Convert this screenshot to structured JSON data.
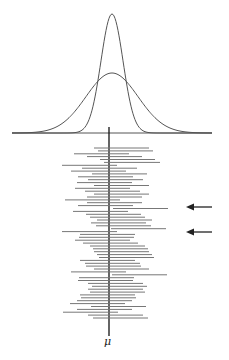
{
  "figure": {
    "mean_label": "μ",
    "curves": [
      {
        "name": "sampling-distribution-narrow",
        "sigma_px": 11,
        "peak_y": 14
      },
      {
        "name": "population-distribution-wide",
        "sigma_px": 26,
        "peak_y": 73
      }
    ],
    "baseline": {
      "x1": 12,
      "x2": 212,
      "y": 133
    },
    "mean_line": {
      "x": 109,
      "y1": 127,
      "y2": 336
    },
    "arrows": [
      {
        "y": 207,
        "x_from": 212,
        "x_to": 186,
        "label": "interval-misses-mean"
      },
      {
        "y": 232,
        "x_from": 212,
        "x_to": 186,
        "label": "interval-misses-mean"
      }
    ],
    "interval_length_px": 56,
    "intervals": [
      [
        94,
        149
      ],
      [
        98,
        153
      ],
      [
        74,
        129
      ],
      [
        87,
        142
      ],
      [
        100,
        155
      ],
      [
        104,
        160
      ],
      [
        62,
        117
      ],
      [
        82,
        137
      ],
      [
        71,
        126
      ],
      [
        92,
        147
      ],
      [
        78,
        133
      ],
      [
        88,
        143
      ],
      [
        77,
        132
      ],
      [
        94,
        149
      ],
      [
        75,
        130
      ],
      [
        85,
        140
      ],
      [
        94,
        149
      ],
      [
        87,
        142
      ],
      [
        65,
        120
      ],
      [
        87,
        142
      ],
      [
        78,
        133
      ],
      [
        113,
        168
      ],
      [
        73,
        128
      ],
      [
        86,
        141
      ],
      [
        90,
        145
      ],
      [
        97,
        152
      ],
      [
        91,
        146
      ],
      [
        96,
        151
      ],
      [
        111,
        166
      ],
      [
        62,
        117
      ],
      [
        80,
        135
      ],
      [
        79,
        134
      ],
      [
        75,
        130
      ],
      [
        83,
        138
      ],
      [
        90,
        145
      ],
      [
        93,
        148
      ],
      [
        94,
        149
      ],
      [
        97,
        152
      ],
      [
        99,
        154
      ],
      [
        80,
        135
      ],
      [
        85,
        140
      ],
      [
        86,
        141
      ],
      [
        94,
        149
      ],
      [
        71,
        126
      ],
      [
        112,
        167
      ],
      [
        79,
        134
      ],
      [
        78,
        133
      ],
      [
        88,
        143
      ],
      [
        92,
        147
      ],
      [
        88,
        143
      ],
      [
        90,
        145
      ],
      [
        80,
        135
      ],
      [
        81,
        136
      ],
      [
        77,
        132
      ],
      [
        70,
        125
      ],
      [
        91,
        146
      ],
      [
        77,
        132
      ],
      [
        63,
        118
      ],
      [
        88,
        143
      ],
      [
        93,
        148
      ]
    ]
  }
}
